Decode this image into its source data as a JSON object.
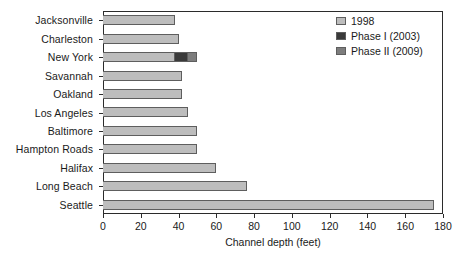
{
  "chart_data": {
    "type": "bar",
    "orientation": "horizontal",
    "title": "",
    "xlabel": "Channel depth (feet)",
    "ylabel": "",
    "xlim": [
      0,
      180
    ],
    "xticks": [
      0,
      20,
      40,
      60,
      80,
      100,
      120,
      140,
      160,
      180
    ],
    "grid": false,
    "legend_position": "top-right",
    "stacked": true,
    "categories": [
      "Jacksonville",
      "Charleston",
      "New York",
      "Savannah",
      "Oakland",
      "Los Angeles",
      "Baltimore",
      "Hampton Roads",
      "Halifax",
      "Long Beach",
      "Seattle"
    ],
    "series": [
      {
        "name": "1998",
        "color": "#bdbdbd",
        "values": [
          38,
          40,
          38,
          42,
          42,
          45,
          50,
          50,
          60,
          76,
          175
        ]
      },
      {
        "name": "Phase I (2003)",
        "color": "#3a3a3a",
        "values": [
          0,
          0,
          7,
          0,
          0,
          0,
          0,
          0,
          0,
          0,
          0
        ]
      },
      {
        "name": "Phase II (2009)",
        "color": "#7d7d7d",
        "values": [
          0,
          0,
          5,
          0,
          0,
          0,
          0,
          0,
          0,
          0,
          0
        ]
      }
    ],
    "totals": [
      38,
      40,
      50,
      42,
      42,
      45,
      50,
      50,
      60,
      76,
      175
    ]
  },
  "legend": {
    "items": [
      {
        "label": "1998",
        "color": "#bdbdbd"
      },
      {
        "label": "Phase I (2003)",
        "color": "#3a3a3a"
      },
      {
        "label": "Phase II (2009)",
        "color": "#7d7d7d"
      }
    ]
  },
  "axis": {
    "x_title": "Channel depth (feet)",
    "x_tick_labels": [
      "0",
      "20",
      "40",
      "60",
      "80",
      "100",
      "120",
      "140",
      "160",
      "180"
    ],
    "y_tick_labels": [
      "Jacksonville",
      "Charleston",
      "New York",
      "Savannah",
      "Oakland",
      "Los Angeles",
      "Baltimore",
      "Hampton Roads",
      "Halifax",
      "Long Beach",
      "Seattle"
    ]
  },
  "colors": {
    "frame": "#2b2b2b",
    "bar_outline": "#5e5e5e",
    "background": "#ffffff",
    "text": "#1a1a1a"
  }
}
